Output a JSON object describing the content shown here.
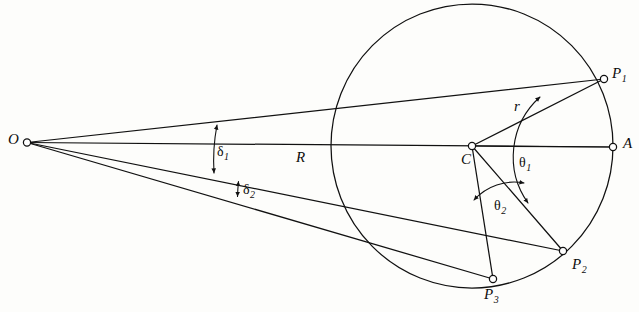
{
  "figure": {
    "type": "geometric-diagram",
    "background_color": "#fdfdfb",
    "stroke_color": "#111111"
  },
  "points": {
    "O": {
      "label": "O",
      "x": 27,
      "y": 142,
      "label_x": 8,
      "label_y": 134,
      "marker": "open-circle"
    },
    "C": {
      "label": "C",
      "x": 472,
      "y": 146,
      "label_x": 461,
      "label_y": 153,
      "marker": "open-circle"
    },
    "A": {
      "label": "A",
      "x": 613,
      "y": 147,
      "label_x": 623,
      "label_y": 137,
      "marker": "open-circle"
    },
    "P1": {
      "label": "P",
      "sub": "1",
      "x": 604,
      "y": 79,
      "label_x": 612,
      "label_y": 66,
      "marker": "open-circle"
    },
    "P2": {
      "label": "P",
      "sub": "2",
      "x": 563,
      "y": 251,
      "label_x": 572,
      "label_y": 258,
      "marker": "open-circle"
    },
    "P3": {
      "label": "P",
      "sub": "3",
      "x": 493,
      "y": 279,
      "label_x": 484,
      "label_y": 288,
      "marker": "open-circle"
    }
  },
  "circle": {
    "name": "scattering-circle",
    "center_x": 472,
    "center_y": 146,
    "radius_x": 141,
    "radius_y": 142
  },
  "segment_labels": {
    "r": {
      "label": "r",
      "x": 514,
      "y": 99,
      "meaning": "circle radius from C to P1"
    },
    "R": {
      "label": "R",
      "x": 296,
      "y": 150,
      "meaning": "distance along axis from O toward C"
    }
  },
  "angle_labels": {
    "delta1": {
      "label": "δ",
      "sub": "1",
      "x": 217,
      "y": 146,
      "meaning": "angular separation at O between ray OP1 and ray OP2"
    },
    "delta2": {
      "label": "δ",
      "sub": "2",
      "x": 243,
      "y": 183,
      "meaning": "angular separation at O between ray OP2 and ray OP3"
    },
    "theta1": {
      "label": "θ",
      "sub": "1",
      "x": 519,
      "y": 157,
      "meaning": "central angle at C from axis CA to CP1"
    },
    "theta2": {
      "label": "θ",
      "sub": "2",
      "x": 494,
      "y": 200,
      "meaning": "central angle at C between CP2 and CP3"
    }
  },
  "rays_from_O": [
    {
      "name": "ray-O-to-A",
      "to": "A"
    },
    {
      "name": "ray-O-to-P1",
      "to": "P1"
    },
    {
      "name": "ray-O-to-P2",
      "to": "P2"
    },
    {
      "name": "ray-O-to-P3",
      "to": "P3"
    }
  ],
  "radii_from_C": [
    {
      "name": "radius-C-to-A",
      "to": "A"
    },
    {
      "name": "radius-C-to-P1",
      "to": "P1"
    },
    {
      "name": "radius-C-to-P2",
      "to": "P2"
    },
    {
      "name": "radius-C-to-P3",
      "to": "P3"
    }
  ]
}
